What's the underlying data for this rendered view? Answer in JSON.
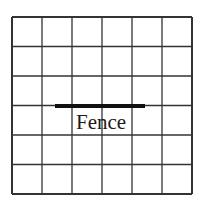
{
  "diagram": {
    "grid": {
      "rows": 6,
      "cols": 6,
      "left": 12,
      "top": 17,
      "right": 192,
      "bottom": 194,
      "line_color": "#333333",
      "line_width": 1.3
    },
    "fence": {
      "label": "Fence",
      "x1": 55,
      "x2": 145,
      "y": 106,
      "thickness": 4,
      "color": "#111111"
    }
  }
}
